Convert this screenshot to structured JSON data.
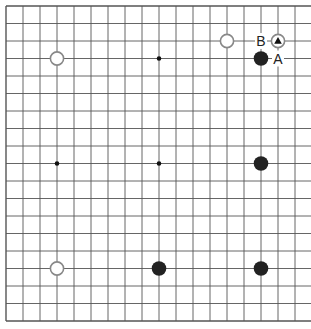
{
  "board": {
    "size": 19,
    "origin_x": 6,
    "origin_y": 6,
    "spacing_x": 17,
    "spacing_y": 17.5,
    "line_color": "#555555",
    "background": "#ffffff",
    "star_points": [
      {
        "col": 9,
        "row": 3
      },
      {
        "col": 3,
        "row": 9
      },
      {
        "col": 9,
        "row": 9
      }
    ],
    "stones": [
      {
        "color": "white",
        "col": 3,
        "row": 3
      },
      {
        "color": "white",
        "col": 13,
        "row": 2
      },
      {
        "color": "white",
        "col": 16,
        "row": 2,
        "marker": "triangle"
      },
      {
        "color": "black",
        "col": 15,
        "row": 3
      },
      {
        "color": "black",
        "col": 15,
        "row": 9
      },
      {
        "color": "white",
        "col": 3,
        "row": 15
      },
      {
        "color": "black",
        "col": 9,
        "row": 15
      },
      {
        "color": "black",
        "col": 15,
        "row": 15
      }
    ],
    "labels": [
      {
        "text": "B",
        "col": 15,
        "row": 2
      },
      {
        "text": "A",
        "col": 16,
        "row": 3
      }
    ]
  },
  "colors": {
    "black_stone": "#222222",
    "white_stone_fill": "#ffffff",
    "white_stone_stroke": "#888888",
    "marker": "#111111"
  }
}
